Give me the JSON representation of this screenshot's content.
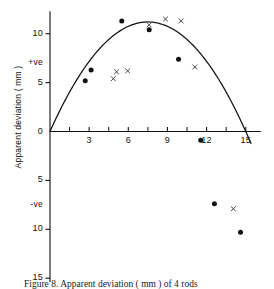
{
  "figure": {
    "caption": "Figure 8.  Apparent deviation ( mm ) of 4 rods",
    "ylabel": "Apparent deviation ( mm )",
    "positive_marker": "+ve",
    "negative_marker": "-ve"
  },
  "chart_data": {
    "type": "scatter",
    "title": "",
    "xlabel": "",
    "ylabel": "Apparent deviation ( mm )",
    "xlim": [
      0,
      16.2
    ],
    "ylim": [
      -15,
      12.5
    ],
    "grid": false,
    "legend": "none",
    "axis_origin_label": "0",
    "x_ticks_major": [
      3,
      6,
      9,
      12,
      15
    ],
    "x_ticks_minor": [
      1.5,
      4.5,
      7.5,
      10.5,
      13.5
    ],
    "x_tick_labels": [
      "3",
      "6",
      "9",
      "12",
      "15"
    ],
    "y_ticks": [
      10,
      5,
      0,
      -5,
      -10,
      -15
    ],
    "y_tick_labels": [
      "10",
      "5",
      "0",
      "5",
      "10",
      "15"
    ],
    "y_annotations": [
      {
        "label": "+ve",
        "value": 7.0
      },
      {
        "label": "-ve",
        "value": -7.5
      }
    ],
    "series": [
      {
        "name": "filled-circles",
        "marker": "circle",
        "color": "#111111",
        "points": [
          {
            "x": 2.7,
            "y": 5.2
          },
          {
            "x": 3.15,
            "y": 6.3
          },
          {
            "x": 5.5,
            "y": 11.3
          },
          {
            "x": 7.6,
            "y": 10.4
          },
          {
            "x": 9.85,
            "y": 7.4
          },
          {
            "x": 11.55,
            "y": -0.9
          },
          {
            "x": 12.6,
            "y": -7.4
          },
          {
            "x": 14.6,
            "y": -10.3
          }
        ]
      },
      {
        "name": "x-markers",
        "marker": "x",
        "color": "#333333",
        "points": [
          {
            "x": 4.85,
            "y": 5.4
          },
          {
            "x": 5.1,
            "y": 6.1
          },
          {
            "x": 5.95,
            "y": 6.2
          },
          {
            "x": 7.6,
            "y": 10.9
          },
          {
            "x": 8.85,
            "y": 11.5
          },
          {
            "x": 10.05,
            "y": 11.3
          },
          {
            "x": 11.1,
            "y": 6.6
          },
          {
            "x": 14.05,
            "y": -7.9
          }
        ]
      }
    ],
    "fit_curve": {
      "name": "fitted-parabola",
      "type": "parabola",
      "color": "#111111",
      "vertex": {
        "x": 7.5,
        "y": 11.2
      },
      "zero_crossings": [
        0.0,
        12.35
      ],
      "end_point": {
        "x": 15.4,
        "y": -13.2
      }
    }
  }
}
